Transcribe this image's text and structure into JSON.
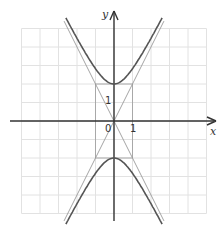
{
  "figure": {
    "type": "hyperbola-graph",
    "equation": "y^2/4 - x^2 = 1",
    "axes": {
      "x_label": "x",
      "y_label": "y",
      "origin_label": "0"
    },
    "tick_labels": {
      "x": "1",
      "y": "1"
    },
    "grid": {
      "unit_px": 18.5,
      "x_range": [
        -5,
        5
      ],
      "y_range": [
        -5,
        5
      ]
    },
    "asymptotes": [
      "y = 2x",
      "y = -2x"
    ],
    "vertices": [
      [
        0,
        2
      ],
      [
        0,
        -2
      ]
    ],
    "guide_rectangle": {
      "x": [
        -1,
        1
      ],
      "y": [
        -2,
        2
      ]
    },
    "colors": {
      "curve": "#555555",
      "asymptote": "#9a9a9a",
      "grid": "#e2e2e2",
      "axis": "#333333",
      "rect": "#9a9a9a"
    }
  }
}
